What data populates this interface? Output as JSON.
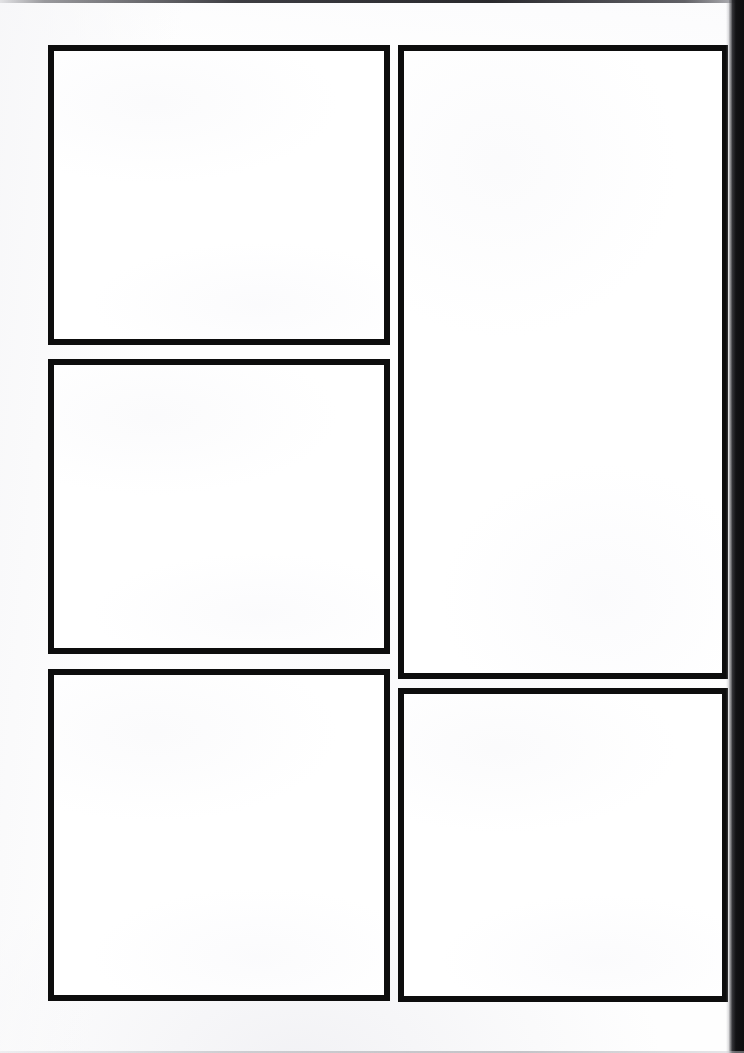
{
  "page": {
    "kind": "blank-comic-page-template",
    "width_px": 744,
    "height_px": 1053,
    "background_color": "#fefefe",
    "panel_border_color": "#0d0d0d",
    "panel_fill_color": "#ffffff",
    "scan_edge_color": "#121214",
    "panel_count": 5,
    "text_content": "",
    "artwork_content": ""
  },
  "panels": [
    {
      "id": "panel-1",
      "label": "",
      "column": "left",
      "order": 1,
      "content": "",
      "x": 48,
      "y": 45,
      "width": 342,
      "height": 300
    },
    {
      "id": "panel-2",
      "label": "",
      "column": "left",
      "order": 2,
      "content": "",
      "x": 48,
      "y": 359,
      "width": 342,
      "height": 295
    },
    {
      "id": "panel-3",
      "label": "",
      "column": "left",
      "order": 3,
      "content": "",
      "x": 48,
      "y": 669,
      "width": 342,
      "height": 332
    },
    {
      "id": "panel-4",
      "label": "",
      "column": "right",
      "order": 4,
      "content": "",
      "x": 398,
      "y": 45,
      "width": 330,
      "height": 634
    },
    {
      "id": "panel-5",
      "label": "",
      "column": "right",
      "order": 5,
      "content": "",
      "x": 398,
      "y": 688,
      "width": 330,
      "height": 314
    }
  ],
  "artifacts": {
    "top_scan_line": "",
    "right_scan_edge": "",
    "bottom_scan_line": ""
  }
}
